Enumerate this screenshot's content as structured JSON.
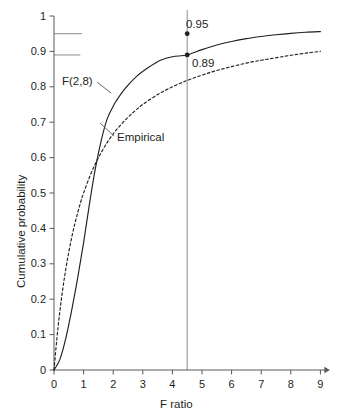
{
  "chart_data": {
    "type": "line",
    "title": "",
    "xlabel": "F ratio",
    "ylabel": "Cumulative probability",
    "xlim": [
      0,
      9
    ],
    "ylim": [
      0,
      1
    ],
    "grid": false,
    "legend_position": "inline-annotations",
    "xticks": [
      "0",
      "1",
      "2",
      "3",
      "4",
      "5",
      "6",
      "7",
      "8",
      "9"
    ],
    "xtick_values": [
      0,
      1,
      2,
      3,
      4,
      5,
      6,
      7,
      8,
      9
    ],
    "yticks": [
      "0",
      "0.1",
      "0.2",
      "0.3",
      "0.4",
      "0.5",
      "0.6",
      "0.7",
      "0.8",
      "0.9",
      "1"
    ],
    "ytick_values": [
      0,
      0.1,
      0.2,
      0.3,
      0.4,
      0.5,
      0.6,
      0.7,
      0.8,
      0.9,
      1.0
    ],
    "series": [
      {
        "name": "F(2,8)",
        "style": "dashed",
        "color": "#231f20",
        "x": [
          0,
          0.1,
          0.2,
          0.3,
          0.4,
          0.5,
          0.6,
          0.7,
          0.8,
          0.9,
          1.0,
          1.2,
          1.4,
          1.6,
          1.8,
          2.0,
          2.25,
          2.5,
          2.75,
          3.0,
          3.5,
          4.0,
          4.5,
          5.0,
          5.5,
          6.0,
          6.5,
          7.0,
          7.5,
          8.0,
          8.5,
          9.0
        ],
        "values": [
          0,
          0.091,
          0.167,
          0.231,
          0.286,
          0.333,
          0.375,
          0.412,
          0.444,
          0.474,
          0.5,
          0.545,
          0.583,
          0.615,
          0.643,
          0.667,
          0.692,
          0.714,
          0.733,
          0.75,
          0.778,
          0.8,
          0.818,
          0.833,
          0.846,
          0.857,
          0.867,
          0.875,
          0.882,
          0.889,
          0.895,
          0.9
        ]
      },
      {
        "name": "Empirical",
        "style": "solid",
        "color": "#231f20",
        "x": [
          0,
          0.2,
          0.4,
          0.6,
          0.8,
          1.0,
          1.2,
          1.4,
          1.6,
          1.8,
          2.0,
          2.1,
          2.4,
          2.8,
          3.2,
          3.6,
          4.0,
          4.5,
          5.0,
          5.5,
          6.0,
          6.5,
          7.0,
          7.5,
          8.0,
          8.5,
          9.0
        ],
        "values": [
          0,
          0.03,
          0.09,
          0.17,
          0.26,
          0.36,
          0.47,
          0.57,
          0.65,
          0.71,
          0.745,
          0.76,
          0.795,
          0.83,
          0.855,
          0.875,
          0.885,
          0.89,
          0.905,
          0.918,
          0.928,
          0.936,
          0.942,
          0.947,
          0.951,
          0.954,
          0.956
        ]
      }
    ],
    "annotations": [
      {
        "label": "0.95",
        "x": 4.5,
        "y": 0.95,
        "marker": true,
        "note": "theoretical F(2,8) critical value"
      },
      {
        "label": "0.89",
        "x": 4.5,
        "y": 0.89,
        "marker": true,
        "note": "empirical cumulative probability"
      }
    ],
    "reference_lines": [
      {
        "orientation": "vertical",
        "value": 4.5,
        "color": "#808080"
      },
      {
        "orientation": "horizontal",
        "value": 0.95,
        "color": "#808080"
      },
      {
        "orientation": "horizontal",
        "value": 0.89,
        "color": "#808080"
      }
    ],
    "curve_labels": [
      {
        "text": "F(2,8)",
        "points_to": "dashed-curve"
      },
      {
        "text": "Empirical",
        "points_to": "solid-curve"
      }
    ]
  }
}
